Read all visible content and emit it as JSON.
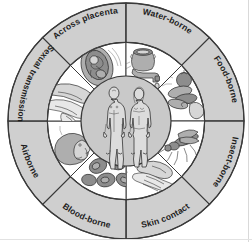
{
  "diagram": {
    "center": {
      "label": "human-figures",
      "figures": [
        "male-figure",
        "female-figure"
      ]
    },
    "colors": {
      "ring_fill": "#cfcfcf",
      "panel_fill": "#ffffff",
      "center_fill": "#c9c9c9",
      "outline": "#3a3a3a",
      "text": "#1d1d1d",
      "background": "#ffffff"
    },
    "sectors": [
      {
        "id": "across-placenta",
        "label": "Across placenta",
        "icon": "fetus-placenta-icon",
        "start_angle": -90,
        "end_angle": -45
      },
      {
        "id": "water-borne",
        "label": "Water-borne",
        "icon": "water-tap-icon",
        "start_angle": -45,
        "end_angle": 0
      },
      {
        "id": "food-borne",
        "label": "Food-borne",
        "icon": "food-platter-icon",
        "start_angle": 0,
        "end_angle": 45
      },
      {
        "id": "insect-borne",
        "label": "Insect-borne",
        "icon": "mosquito-icon",
        "start_angle": 45,
        "end_angle": 90
      },
      {
        "id": "skin-contact",
        "label": "Skin contact",
        "icon": "handshake-icon",
        "start_angle": 90,
        "end_angle": 135
      },
      {
        "id": "blood-borne",
        "label": "Blood-borne",
        "icon": "blood-cells-icon",
        "start_angle": 135,
        "end_angle": 180
      },
      {
        "id": "airborne",
        "label": "Airborne",
        "icon": "sneezing-head-icon",
        "start_angle": 180,
        "end_angle": 225
      },
      {
        "id": "sexual-transmission",
        "label": "Sexual transmission",
        "icon": "embracing-legs-icon",
        "start_angle": 225,
        "end_angle": 270
      }
    ]
  }
}
